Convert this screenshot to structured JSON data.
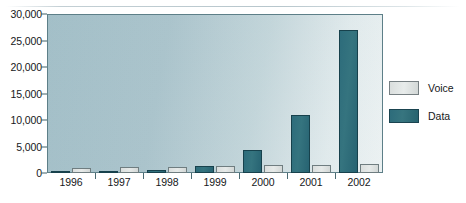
{
  "chart_data": {
    "type": "bar",
    "title": "",
    "subtitle": "",
    "xlabel": "",
    "ylabel": "",
    "categories": [
      "1996",
      "1997",
      "1998",
      "1999",
      "2000",
      "2001",
      "2002"
    ],
    "series": [
      {
        "name": "Data",
        "color": "#2d6c7b",
        "values": [
          200,
          350,
          550,
          1400,
          4300,
          11000,
          27000
        ]
      },
      {
        "name": "Voice",
        "color": "#dadedd",
        "values": [
          900,
          1100,
          1200,
          1300,
          1500,
          1600,
          1700
        ]
      }
    ],
    "series_draw_order": [
      "Data",
      "Voice"
    ],
    "ylim": [
      0,
      30000
    ],
    "ytick_values": [
      0,
      5000,
      10000,
      15000,
      20000,
      25000,
      30000
    ],
    "ytick_labels": [
      "0",
      "5,000",
      "10,000",
      "15,000",
      "20,000",
      "25,000",
      "30,000"
    ],
    "grid": false,
    "legend_position": "right",
    "legend_entries": [
      {
        "label": "Voice",
        "color": "#dadedd"
      },
      {
        "label": "Data",
        "color": "#2d6c7b"
      }
    ],
    "plot_background": "#a8c3cb",
    "axis_color": "#3f6068"
  }
}
